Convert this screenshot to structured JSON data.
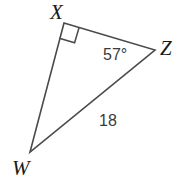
{
  "figure": {
    "kind": "geometry-diagram",
    "shape": "triangle",
    "background_color": "#ffffff",
    "stroke_color": "#4a4a4a",
    "stroke_width": 1.6,
    "label_color": "#1a1a1a",
    "measure_color": "#3a3a3a"
  },
  "vertices": {
    "X": {
      "label": "X",
      "x": 64,
      "y": 23
    },
    "Z": {
      "label": "Z",
      "x": 155,
      "y": 50
    },
    "W": {
      "label": "W",
      "x": 30,
      "y": 152
    }
  },
  "sides": [
    {
      "name": "XZ",
      "from": "X",
      "to": "Z"
    },
    {
      "name": "ZW",
      "from": "Z",
      "to": "W"
    },
    {
      "name": "WX",
      "from": "W",
      "to": "X"
    }
  ],
  "markers": {
    "right_angle": {
      "at_vertex": "X",
      "type": "square",
      "size": 16
    }
  },
  "annotations": {
    "angle_Z": {
      "text": "57°",
      "at_vertex": "Z",
      "value": 57,
      "unit": "degrees"
    },
    "side_WZ": {
      "text": "18",
      "on_side": "ZW",
      "value": 18
    }
  }
}
